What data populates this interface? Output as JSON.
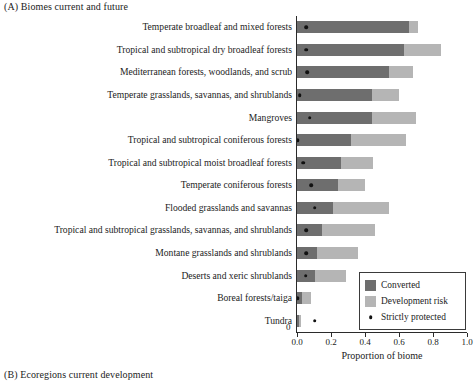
{
  "figure": {
    "panel_a_title": "(A)  Biomes current and future",
    "panel_b_title": "(B)  Ecoregions current development"
  },
  "legend": {
    "items": [
      {
        "label": "Converted",
        "color": "#6e6e6e",
        "marker": "swatch"
      },
      {
        "label": "Development risk",
        "color": "#b5b5b5",
        "marker": "swatch"
      },
      {
        "label": "Strictly protected",
        "color": "#111111",
        "marker": "dot"
      }
    ]
  },
  "axis": {
    "zero_label": "0",
    "tick_labels": [
      "0.0",
      "0.2",
      "0.4",
      "0.6",
      "0.8",
      "1.0"
    ],
    "tick_values": [
      0.0,
      0.2,
      0.4,
      0.6,
      0.8,
      1.0
    ]
  },
  "chart_data": {
    "type": "bar",
    "orientation": "horizontal",
    "stacked": true,
    "title": "(A)  Biomes current and future",
    "xlabel": "Proportion of biome",
    "ylabel": "",
    "xlim": [
      0.0,
      1.0
    ],
    "grid": false,
    "legend_position": "bottom-right",
    "categories": [
      "Temperate broadleaf and mixed forests",
      "Tropical and subtropical dry broadleaf forests",
      "Mediterranean forests, woodlands, and scrub",
      "Temperate grasslands, savannas, and shrublands",
      "Mangroves",
      "Tropical and subtropical coniferous forests",
      "Tropical and subtropical moist broadleaf forests",
      "Temperate coniferous forests",
      "Flooded grasslands and savannas",
      "Tropical and subtropical grasslands, savannas, and shrublands",
      "Montane grasslands and shrublands",
      "Deserts and xeric shrublands",
      "Boreal forests/taiga",
      "Tundra"
    ],
    "series": [
      {
        "name": "Converted",
        "color": "#6e6e6e",
        "values": [
          0.66,
          0.63,
          0.54,
          0.44,
          0.44,
          0.32,
          0.26,
          0.24,
          0.21,
          0.145,
          0.12,
          0.105,
          0.03,
          0.012
        ]
      },
      {
        "name": "Development risk",
        "color": "#b5b5b5",
        "values": [
          0.05,
          0.22,
          0.14,
          0.16,
          0.26,
          0.32,
          0.19,
          0.16,
          0.33,
          0.315,
          0.24,
          0.185,
          0.055,
          0.014
        ]
      },
      {
        "name": "Strictly protected",
        "color": "#111111",
        "marker": "dot",
        "values": [
          0.055,
          0.055,
          0.06,
          0.015,
          0.075,
          0.005,
          0.035,
          0.085,
          0.105,
          0.055,
          0.055,
          0.05,
          0.005,
          0.105
        ]
      }
    ]
  }
}
